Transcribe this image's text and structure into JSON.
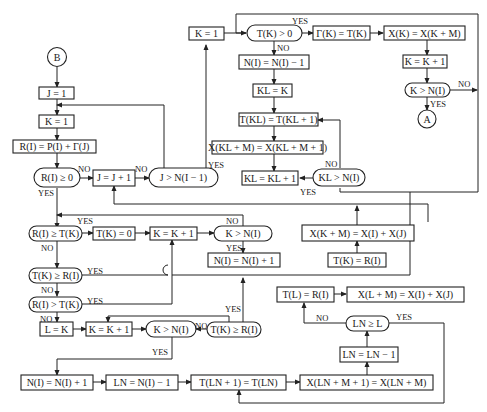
{
  "diagram": {
    "type": "flowchart",
    "connectors": {
      "B": "B",
      "A": "A"
    },
    "nodes": {
      "j_init": "J = 1",
      "k_init1": "K = 1",
      "r_calc": "R(I) = P(I) + Γ(J)",
      "r_ge0": "R(I) ≥ 0",
      "j_inc": "J = J + 1",
      "j_gt": "J > N(I − 1)",
      "k_init2": "K = 1",
      "tk_gt0": "T(K) > 0",
      "gamma_set": "Γ(K) = T(K)",
      "xk_set": "X(K) = X(K + M)",
      "k_inc_top": "K = K + 1",
      "k_gt_top": "K > N(I)",
      "ni_dec": "N(I) = N(I) − 1",
      "kl_set": "KL = K",
      "tkl_set": "T(KL) = T(KL + 1)",
      "xkl_set": "X(KL + M) = X(KL + M + 1)",
      "kl_inc": "KL = KL + 1",
      "kl_gt": "KL > N(I)",
      "ri_ge_tk": "R(I) ≥ T(K)",
      "tk_zero": "T(K) = 0",
      "k_inc_mid": "K = K + 1",
      "k_gt_mid": "K > N(I)",
      "ni_inc_mid": "N(I) = N(I) + 1",
      "xkm_set": "X(K + M) = X(I) + X(J)",
      "tk_ri": "T(K) = R(I)",
      "tk_ge_ri": "T(K) ≥ R(I)",
      "ri_gt_tk": "R(I) > T(K)",
      "l_set": "L = K",
      "k_inc_low": "K = K + 1",
      "k_gt_low": "K > N(I)",
      "tk_ge_ri2": "T(K) ≥ R(I)",
      "tl_set": "T(L) = R(I)",
      "xlm_set": "X(L + M) = X(I) + X(J)",
      "ln_ge_l": "LN ≥ L",
      "ln_dec": "LN = LN − 1",
      "ni_inc_bot": "N(I) = N(I) + 1",
      "ln_set": "LN = N(I) − 1",
      "tln_set": "T(LN + 1) = T(LN)",
      "xln_set": "X(LN + M + 1) = X(LN + M)"
    },
    "labels": {
      "yes": "YES",
      "no": "NO"
    }
  }
}
